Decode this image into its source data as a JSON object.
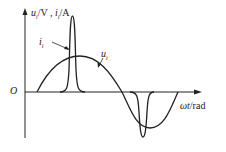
{
  "diagram": {
    "y_axis_label_u": "u",
    "y_axis_label_u_sub": "i",
    "y_axis_label_unit_v": "/V , ",
    "y_axis_label_i": "i",
    "y_axis_label_i_sub": "i",
    "y_axis_label_unit_a": "/A",
    "x_axis_label_var": "ωt",
    "x_axis_label_unit": "/rad",
    "origin_label": "O",
    "curve_current_label": "i",
    "curve_current_sub": "i",
    "curve_voltage_label": "u",
    "curve_voltage_sub": "i"
  }
}
